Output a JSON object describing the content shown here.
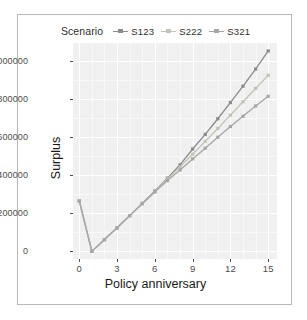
{
  "chart_data": {
    "type": "line",
    "title": "",
    "xlabel": "Policy anniversary",
    "ylabel": "Surplus",
    "legend_title": "Scenario",
    "legend_position": "top",
    "grid": true,
    "xlim": [
      -0.5,
      15.7
    ],
    "ylim": [
      -40000,
      1095000
    ],
    "xticks": [
      0,
      3,
      6,
      9,
      12,
      15
    ],
    "xticklabels": [
      "0",
      "3",
      "6",
      "9",
      "12",
      "15"
    ],
    "yticks": [
      0,
      200000,
      400000,
      600000,
      800000,
      1000000
    ],
    "yticklabels": [
      "0",
      "200000",
      "400000",
      "600000",
      "800000",
      "1000000"
    ],
    "x": [
      0,
      1,
      2,
      3,
      4,
      5,
      6,
      7,
      8,
      9,
      10,
      11,
      12,
      13,
      14,
      15
    ],
    "series": [
      {
        "name": "S123",
        "color": "#8b8b8b",
        "values": [
          265000,
          0,
          62000,
          124000,
          188000,
          252000,
          318000,
          385000,
          455000,
          538000,
          615000,
          697000,
          782000,
          868000,
          958000,
          1053000
        ]
      },
      {
        "name": "S222",
        "color": "#c2c2b8",
        "values": [
          265000,
          0,
          62000,
          124000,
          188000,
          252000,
          316000,
          380000,
          444000,
          510000,
          578000,
          646000,
          716000,
          786000,
          856000,
          925000
        ]
      },
      {
        "name": "S321",
        "color": "#a6a6a6",
        "values": [
          265000,
          0,
          62000,
          124000,
          188000,
          250000,
          312000,
          372000,
          428000,
          486000,
          542000,
          600000,
          656000,
          710000,
          764000,
          815000
        ]
      }
    ]
  },
  "legend": {
    "title": "Scenario",
    "items": [
      {
        "label": "S123"
      },
      {
        "label": "S222"
      },
      {
        "label": "S321"
      }
    ]
  },
  "axes": {
    "x_label": "Policy anniversary",
    "y_label": "Surplus",
    "x_ticklabels": [
      "0",
      "3",
      "6",
      "9",
      "12",
      "15"
    ],
    "y_ticklabels": [
      "0",
      "200000",
      "400000",
      "600000",
      "800000",
      "1000000"
    ]
  },
  "colors": {
    "panel_background": "#f0f0f0",
    "grid_major": "#ffffff",
    "figure_background": "#ffffff",
    "figure_border": "#b9b9b9",
    "text": "#1a1a1a",
    "tick_text": "#4d4d4d"
  }
}
